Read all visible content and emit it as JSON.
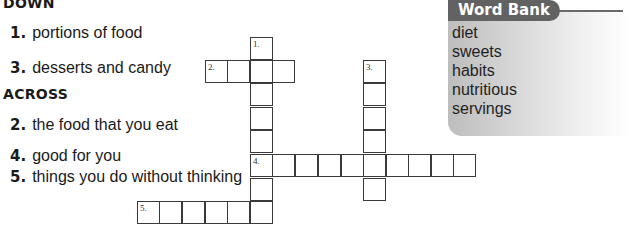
{
  "down": {
    "heading": "DOWN",
    "clues": [
      {
        "num": "1.",
        "text": "portions of food"
      },
      {
        "num": "3.",
        "text": "desserts and candy"
      }
    ]
  },
  "across": {
    "heading": "ACROSS",
    "clues": [
      {
        "num": "2.",
        "text": "the food that you eat"
      },
      {
        "num": "4.",
        "text": "good for you"
      },
      {
        "num": "5.",
        "text": "things you do without thinking"
      }
    ]
  },
  "grid": {
    "labels": {
      "c1": "1.",
      "c2": "2.",
      "c3": "3.",
      "c4": "4.",
      "c5": "5."
    },
    "entries": [
      {
        "number": "1",
        "direction": "down",
        "length": 8
      },
      {
        "number": "2",
        "direction": "across",
        "length": 4
      },
      {
        "number": "3",
        "direction": "down",
        "length": 6
      },
      {
        "number": "4",
        "direction": "across",
        "length": 10
      },
      {
        "number": "5",
        "direction": "across",
        "length": 6
      }
    ]
  },
  "word_bank": {
    "title": "Word Bank",
    "words": [
      "diet",
      "sweets",
      "habits",
      "nutritious",
      "servings"
    ]
  },
  "colors": {
    "title_pill": "#626262",
    "grid_line": "#3a3a3a",
    "bank_gradient_start": "#bdbdbd",
    "bank_gradient_end": "#ffffff"
  }
}
